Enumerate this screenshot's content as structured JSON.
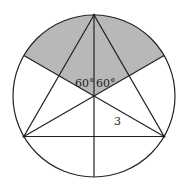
{
  "diagram": {
    "type": "geometry",
    "labels": {
      "angle_left": "60°",
      "angle_right": "60°",
      "segment_length": "3"
    },
    "colors": {
      "stroke": "#222222",
      "shade": "#b8b8b8",
      "background": "#ffffff"
    }
  }
}
